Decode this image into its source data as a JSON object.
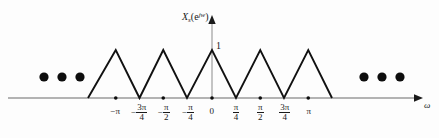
{
  "figure": {
    "kind": "signal-spectrum-plot",
    "y_axis_label": {
      "base": "X",
      "subscript": "s",
      "open_paren": "(",
      "exponent_base": "e",
      "exponent": "jw",
      "close_paren": ")"
    },
    "x_axis_label": "ω",
    "amplitude_label": "1",
    "colors": {
      "curve": "#111111",
      "axis": "#9a9a9a",
      "arrow": "#1a1a1a",
      "dot": "#0d0d0d",
      "text": "#1a1a1a",
      "background": "#fdfdfd"
    }
  },
  "chart_data": {
    "type": "line",
    "title": "",
    "xlabel": "ω",
    "ylabel": "X_s(e^{jω})",
    "xlim": [
      -1.75,
      1.75
    ],
    "ylim": [
      0,
      1.15
    ],
    "grid": false,
    "legend": null,
    "x_unit": "pi",
    "period_in_pi": 0.5,
    "peak_value": 1,
    "x": [
      -1.25,
      -1.0,
      -0.75,
      -0.5,
      -0.25,
      0,
      0.25,
      0.5,
      0.75,
      1.0,
      1.25
    ],
    "values": [
      0,
      1,
      0,
      1,
      0,
      1,
      0,
      1,
      0,
      1,
      0
    ],
    "peaks_in_pi": [
      -1.0,
      -0.5,
      0,
      0.5,
      1.0
    ],
    "zeros_in_pi": [
      -1.25,
      -0.75,
      -0.25,
      0.25,
      0.75,
      1.25
    ],
    "xticks_in_pi": [
      -1,
      -0.75,
      -0.5,
      -0.25,
      0,
      0.25,
      0.5,
      0.75,
      1
    ],
    "xticklabels": [
      {
        "id": "neg-pi",
        "sign": "−",
        "type": "plain",
        "text": "π"
      },
      {
        "id": "neg-3pi-over-4",
        "sign": "−",
        "type": "fraction",
        "num": "3π",
        "den": "4"
      },
      {
        "id": "neg-pi-over-2",
        "sign": "−",
        "type": "fraction",
        "num": "π",
        "den": "2"
      },
      {
        "id": "neg-pi-over-4",
        "sign": "−",
        "type": "fraction",
        "num": "π",
        "den": "4"
      },
      {
        "id": "zero",
        "sign": "",
        "type": "plain",
        "text": "0"
      },
      {
        "id": "pi-over-4",
        "sign": "",
        "type": "fraction",
        "num": "π",
        "den": "4"
      },
      {
        "id": "pi-over-2",
        "sign": "",
        "type": "fraction",
        "num": "π",
        "den": "2"
      },
      {
        "id": "3pi-over-4",
        "sign": "",
        "type": "fraction",
        "num": "3π",
        "den": "4"
      },
      {
        "id": "pi",
        "sign": "",
        "type": "plain",
        "text": "π"
      }
    ],
    "marker_dots_in_pi": [
      -1.0,
      -0.5,
      0,
      0.5,
      1.0
    ],
    "ellipsis_left_count": 3,
    "ellipsis_right_count": 3
  },
  "geometry": {
    "baseline_y": 98,
    "peak_y": 50,
    "origin_x": 212,
    "pi_px": 97,
    "y_axis_top": 16,
    "x_axis_start": 8,
    "x_axis_end": 422,
    "ellipsis_y": 77,
    "ellipsis_left_x": [
      44,
      62,
      80
    ],
    "ellipsis_right_x": [
      364,
      382,
      400
    ],
    "dot_radius": 4.5,
    "tick_dot_radius": 1.7
  }
}
